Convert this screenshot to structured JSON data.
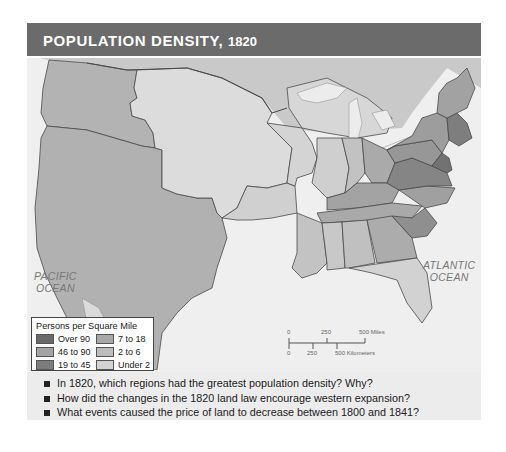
{
  "title": {
    "text": "POPULATION DENSITY,",
    "year": "1820"
  },
  "map": {
    "ocean_labels": [
      {
        "line1": "PACIFIC",
        "line2": "OCEAN"
      },
      {
        "line1": "ATLANTIC",
        "line2": "OCEAN"
      }
    ],
    "colors": {
      "over_90": "#6a6a6a",
      "46_to_90": "#9a9a9a",
      "19_to_45": "#7c7c7c",
      "7_to_18": "#a8a8a8",
      "2_to_6": "#bdbdbd",
      "under_2": "#d6d6d6",
      "ocean": "#efefef",
      "foreign": "#c8c8c8",
      "border": "#4a4a4a"
    }
  },
  "legend": {
    "title": "Persons per Square Mile",
    "items": [
      {
        "label": "Over 90",
        "color": "#6a6a6a"
      },
      {
        "label": "7 to 18",
        "color": "#a8a8a8"
      },
      {
        "label": "46 to 90",
        "color": "#a3a3a3"
      },
      {
        "label": "2 to 6",
        "color": "#bdbdbd"
      },
      {
        "label": "19 to 45",
        "color": "#7c7c7c"
      },
      {
        "label": "Under 2",
        "color": "#d3d3d3"
      }
    ]
  },
  "scale": {
    "miles": {
      "zero": "0",
      "mid": "250",
      "end": "500 Miles"
    },
    "km": {
      "zero": "0",
      "mid": "250",
      "end": "500 Kilometers"
    }
  },
  "questions": [
    "In 1820, which regions had the greatest population density? Why?",
    "How did the changes in the 1820 land law encourage western expansion?",
    "What events caused the price of land to decrease between 1800 and 1841?"
  ]
}
